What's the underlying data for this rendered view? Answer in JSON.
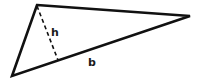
{
  "diagram": {
    "shape": "triangle",
    "vertices": {
      "top": [
        37,
        5
      ],
      "right": [
        190,
        16
      ],
      "bottom_left": [
        12,
        76
      ]
    },
    "height_foot": [
      58,
      60
    ],
    "labels": {
      "height": "h",
      "base": "b"
    },
    "colors": {
      "stroke": "#111111",
      "background": "#ffffff"
    }
  }
}
